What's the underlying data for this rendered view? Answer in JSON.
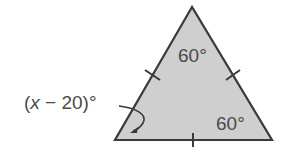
{
  "diagram": {
    "shape": "equilateral-triangle",
    "fill_color": "#cfcfcf",
    "stroke_color": "#3a3a3a",
    "angles": {
      "top": "60°",
      "bottom_right": "60°",
      "bottom_left_label": {
        "open_paren": "(",
        "variable": "x",
        "rest": " − 20)°"
      }
    },
    "tick_marks": 3
  }
}
